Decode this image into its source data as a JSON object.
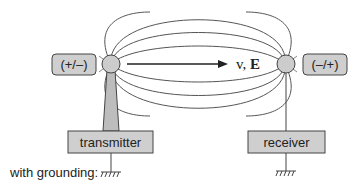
{
  "diagram": {
    "top_cut_text": "Figure caption text (cut off above page)",
    "left_charge_label": "(+/–)",
    "right_charge_label": "(–/+)",
    "propagation_label_v": "v, ",
    "propagation_label_E": "E",
    "transmitter_label": "transmitter",
    "receiver_label": "receiver",
    "grounding_label": "with grounding:",
    "colors": {
      "box_fill": "#cfcfcf",
      "sphere_fill": "#cccccc",
      "stroke": "#444444",
      "background": "#ffffff"
    }
  }
}
